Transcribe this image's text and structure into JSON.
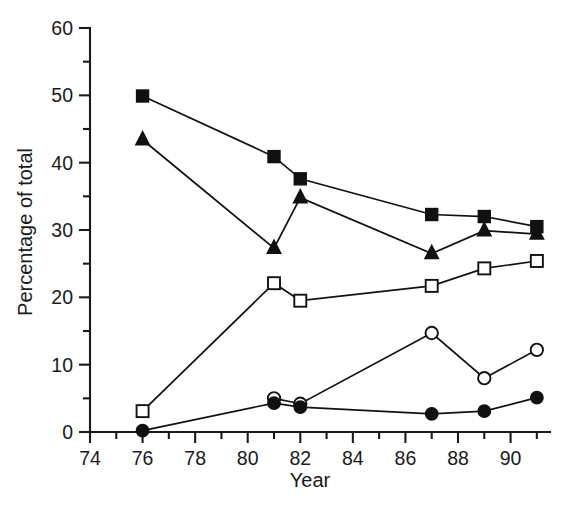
{
  "chart_data": {
    "type": "line",
    "title": "",
    "subtitle": "",
    "xlabel": "Year",
    "ylabel": "Percentage of total",
    "xlim": [
      74,
      91.5
    ],
    "ylim": [
      0,
      60
    ],
    "x_major_ticks": [
      74,
      76,
      78,
      80,
      82,
      84,
      86,
      88,
      90
    ],
    "x_major_tick_labels": [
      "74",
      "76",
      "78",
      "80",
      "82",
      "84",
      "86",
      "88",
      "90"
    ],
    "x_minor_ticks": [
      75,
      77,
      79,
      81,
      83,
      85,
      87,
      89,
      91
    ],
    "y_major_ticks": [
      0,
      10,
      20,
      30,
      40,
      50,
      60
    ],
    "y_major_tick_labels": [
      "0",
      "10",
      "20",
      "30",
      "40",
      "50",
      "60"
    ],
    "y_minor_ticks": [
      5,
      15,
      25,
      35,
      45,
      55
    ],
    "grid": false,
    "legend": "none",
    "line_color": "#111111",
    "axis_color": "#1a1a1a",
    "series": [
      {
        "name": "filled-square",
        "marker": "filled-square",
        "x": [
          76,
          81,
          82,
          87,
          89,
          91
        ],
        "values": [
          49.9,
          40.9,
          37.6,
          32.3,
          32.0,
          30.5
        ]
      },
      {
        "name": "filled-triangle",
        "marker": "filled-triangle",
        "x": [
          76,
          81,
          82,
          87,
          89,
          91
        ],
        "values": [
          43.4,
          27.3,
          34.8,
          26.5,
          29.9,
          29.4
        ]
      },
      {
        "name": "open-square",
        "marker": "open-square",
        "x": [
          76,
          81,
          82,
          87,
          89,
          91
        ],
        "values": [
          3.1,
          22.1,
          19.5,
          21.7,
          24.3,
          25.4
        ]
      },
      {
        "name": "open-circle",
        "marker": "open-circle",
        "x": [
          81,
          82,
          87,
          89,
          91
        ],
        "values": [
          5.0,
          4.2,
          14.7,
          8.0,
          12.2
        ]
      },
      {
        "name": "filled-circle",
        "marker": "filled-circle",
        "x": [
          76,
          81,
          82,
          87,
          89,
          91
        ],
        "values": [
          0.2,
          4.3,
          3.7,
          2.7,
          3.1,
          5.1
        ]
      }
    ]
  }
}
